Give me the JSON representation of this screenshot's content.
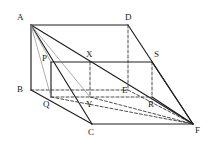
{
  "figure": {
    "type": "3d-prism-with-inscribed-box",
    "canvas": {
      "width": 215,
      "height": 145,
      "background": "#ffffff"
    },
    "stroke": {
      "solid_color": "#1f1f1f",
      "dashed_color": "#3a3a3a",
      "thin_color": "#8a8a8a",
      "solid_width": 1.15,
      "dashed_width": 0.9,
      "thin_width": 0.7,
      "dash_pattern": "3,2"
    },
    "vertices": [
      {
        "id": "A",
        "label": "A",
        "x": 31,
        "y": 25,
        "label_x": 17,
        "label_y": 13,
        "hidden": false
      },
      {
        "id": "D",
        "label": "D",
        "x": 128,
        "y": 25,
        "label_x": 125,
        "label_y": 13,
        "hidden": false
      },
      {
        "id": "B",
        "label": "B",
        "x": 31,
        "y": 90,
        "label_x": 17,
        "label_y": 85,
        "hidden": false
      },
      {
        "id": "E",
        "label": "E",
        "x": 128,
        "y": 90,
        "label_x": 122,
        "label_y": 86,
        "hidden": true
      },
      {
        "id": "C",
        "label": "C",
        "x": 92,
        "y": 124,
        "label_x": 88,
        "label_y": 128,
        "hidden": false
      },
      {
        "id": "F",
        "label": "F",
        "x": 193,
        "y": 124,
        "label_x": 195,
        "label_y": 126,
        "hidden": false
      },
      {
        "id": "P",
        "label": "P",
        "x": 51,
        "y": 62,
        "label_x": 42,
        "label_y": 54,
        "hidden": false
      },
      {
        "id": "X",
        "label": "X",
        "x": 90,
        "y": 62,
        "label_x": 86,
        "label_y": 50,
        "hidden": false
      },
      {
        "id": "S",
        "label": "S",
        "x": 152,
        "y": 62,
        "label_x": 154,
        "label_y": 50,
        "hidden": false
      },
      {
        "id": "Q",
        "label": "Q",
        "x": 51,
        "y": 97,
        "label_x": 43,
        "label_y": 100,
        "hidden": false
      },
      {
        "id": "Y",
        "label": "Y",
        "x": 90,
        "y": 97,
        "label_x": 86,
        "label_y": 100,
        "hidden": true
      },
      {
        "id": "R",
        "label": "R",
        "x": 152,
        "y": 97,
        "label_x": 148,
        "label_y": 100,
        "hidden": true
      }
    ],
    "edges": [
      {
        "from": "A",
        "to": "D",
        "style": "solid",
        "name": "edge-a-d"
      },
      {
        "from": "A",
        "to": "B",
        "style": "solid",
        "name": "edge-a-b"
      },
      {
        "from": "B",
        "to": "C",
        "style": "solid",
        "name": "edge-b-c"
      },
      {
        "from": "C",
        "to": "F",
        "style": "solid",
        "name": "edge-c-f"
      },
      {
        "from": "D",
        "to": "F",
        "style": "solid",
        "name": "edge-d-f"
      },
      {
        "from": "A",
        "to": "F",
        "style": "solid",
        "name": "edge-a-f"
      },
      {
        "from": "A",
        "to": "C",
        "style": "solid",
        "name": "edge-a-c"
      },
      {
        "from": "B",
        "to": "E",
        "style": "dashed",
        "name": "edge-b-e"
      },
      {
        "from": "D",
        "to": "E",
        "style": "dashed",
        "name": "edge-d-e"
      },
      {
        "from": "E",
        "to": "F",
        "style": "dashed",
        "name": "edge-e-f"
      },
      {
        "from": "P",
        "to": "X",
        "style": "solid",
        "name": "edge-p-x"
      },
      {
        "from": "X",
        "to": "S",
        "style": "solid",
        "name": "edge-x-s"
      },
      {
        "from": "P",
        "to": "Q",
        "style": "solid",
        "name": "edge-p-q"
      },
      {
        "from": "Q",
        "to": "R",
        "style": "dashed",
        "name": "edge-q-r"
      },
      {
        "from": "X",
        "to": "Y",
        "style": "dashed",
        "name": "edge-x-y"
      },
      {
        "from": "S",
        "to": "R",
        "style": "dashed",
        "name": "edge-s-r"
      },
      {
        "from": "A",
        "to": "P",
        "style": "thin",
        "name": "edge-a-p"
      },
      {
        "from": "A",
        "to": "Q",
        "style": "thin",
        "name": "edge-a-q"
      },
      {
        "from": "A",
        "to": "Y",
        "style": "thin",
        "name": "edge-a-y"
      },
      {
        "from": "Q",
        "to": "F",
        "style": "dashed",
        "name": "edge-q-f"
      },
      {
        "from": "Y",
        "to": "F",
        "style": "dashed",
        "name": "edge-y-f"
      },
      {
        "from": "S",
        "to": "F",
        "style": "solid",
        "name": "edge-s-f"
      },
      {
        "from": "R",
        "to": "F",
        "style": "solid",
        "name": "edge-r-f"
      }
    ]
  }
}
